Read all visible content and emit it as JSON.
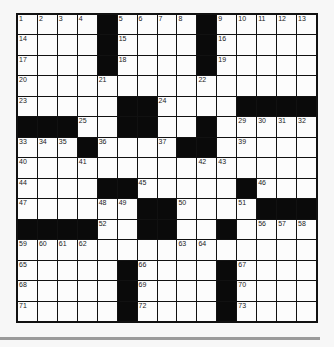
{
  "puzzle": {
    "rows": 15,
    "cols": 15,
    "grid": [
      "....#....#.....",
      "....#....#.....",
      "....#....#.....",
      "...............",
      ".....##....####",
      "###..##..#.....",
      "...#....##.....",
      "...............",
      "....##.....#...",
      "......##....###",
      "####..##..#....",
      "...............",
      ".....#....#....",
      ".....#....#....",
      ".....#....#...."
    ],
    "numbers": [
      {
        "r": 0,
        "c": 0,
        "n": "1"
      },
      {
        "r": 0,
        "c": 1,
        "n": "2"
      },
      {
        "r": 0,
        "c": 2,
        "n": "3"
      },
      {
        "r": 0,
        "c": 3,
        "n": "4"
      },
      {
        "r": 0,
        "c": 5,
        "n": "5"
      },
      {
        "r": 0,
        "c": 6,
        "n": "6"
      },
      {
        "r": 0,
        "c": 7,
        "n": "7"
      },
      {
        "r": 0,
        "c": 8,
        "n": "8"
      },
      {
        "r": 0,
        "c": 10,
        "n": "9"
      },
      {
        "r": 0,
        "c": 11,
        "n": "10"
      },
      {
        "r": 0,
        "c": 12,
        "n": "11"
      },
      {
        "r": 0,
        "c": 13,
        "n": "12"
      },
      {
        "r": 0,
        "c": 14,
        "n": "13"
      },
      {
        "r": 1,
        "c": 0,
        "n": "14"
      },
      {
        "r": 1,
        "c": 5,
        "n": "15"
      },
      {
        "r": 1,
        "c": 10,
        "n": "16"
      },
      {
        "r": 2,
        "c": 0,
        "n": "17"
      },
      {
        "r": 2,
        "c": 5,
        "n": "18"
      },
      {
        "r": 2,
        "c": 10,
        "n": "19"
      },
      {
        "r": 3,
        "c": 0,
        "n": "20"
      },
      {
        "r": 3,
        "c": 4,
        "n": "21"
      },
      {
        "r": 3,
        "c": 9,
        "n": "22"
      },
      {
        "r": 4,
        "c": 0,
        "n": "23"
      },
      {
        "r": 4,
        "c": 7,
        "n": "24"
      },
      {
        "r": 5,
        "c": 3,
        "n": "25"
      },
      {
        "r": 5,
        "c": 5,
        "n": "26"
      },
      {
        "r": 5,
        "c": 6,
        "n": "27"
      },
      {
        "r": 5,
        "c": 9,
        "n": "28"
      },
      {
        "r": 5,
        "c": 11,
        "n": "29"
      },
      {
        "r": 5,
        "c": 12,
        "n": "30"
      },
      {
        "r": 5,
        "c": 13,
        "n": "31"
      },
      {
        "r": 5,
        "c": 14,
        "n": "32"
      },
      {
        "r": 6,
        "c": 0,
        "n": "33"
      },
      {
        "r": 6,
        "c": 1,
        "n": "34"
      },
      {
        "r": 6,
        "c": 2,
        "n": "35"
      },
      {
        "r": 6,
        "c": 4,
        "n": "36"
      },
      {
        "r": 6,
        "c": 7,
        "n": "37"
      },
      {
        "r": 6,
        "c": 8,
        "n": "38"
      },
      {
        "r": 6,
        "c": 11,
        "n": "39"
      },
      {
        "r": 7,
        "c": 0,
        "n": "40"
      },
      {
        "r": 7,
        "c": 3,
        "n": "41"
      },
      {
        "r": 7,
        "c": 9,
        "n": "42"
      },
      {
        "r": 7,
        "c": 10,
        "n": "43"
      },
      {
        "r": 8,
        "c": 0,
        "n": "44"
      },
      {
        "r": 8,
        "c": 6,
        "n": "45"
      },
      {
        "r": 8,
        "c": 12,
        "n": "46"
      },
      {
        "r": 9,
        "c": 0,
        "n": "47"
      },
      {
        "r": 9,
        "c": 4,
        "n": "48"
      },
      {
        "r": 9,
        "c": 5,
        "n": "49"
      },
      {
        "r": 9,
        "c": 8,
        "n": "50"
      },
      {
        "r": 9,
        "c": 11,
        "n": "51"
      },
      {
        "r": 10,
        "c": 4,
        "n": "52"
      },
      {
        "r": 10,
        "c": 6,
        "n": "53"
      },
      {
        "r": 10,
        "c": 7,
        "n": "54"
      },
      {
        "r": 10,
        "c": 10,
        "n": "55"
      },
      {
        "r": 10,
        "c": 12,
        "n": "56"
      },
      {
        "r": 10,
        "c": 13,
        "n": "57"
      },
      {
        "r": 10,
        "c": 14,
        "n": "58"
      },
      {
        "r": 11,
        "c": 0,
        "n": "59"
      },
      {
        "r": 11,
        "c": 1,
        "n": "60"
      },
      {
        "r": 11,
        "c": 2,
        "n": "61"
      },
      {
        "r": 11,
        "c": 3,
        "n": "62"
      },
      {
        "r": 11,
        "c": 8,
        "n": "63"
      },
      {
        "r": 11,
        "c": 9,
        "n": "64"
      },
      {
        "r": 12,
        "c": 0,
        "n": "65"
      },
      {
        "r": 12,
        "c": 6,
        "n": "66"
      },
      {
        "r": 12,
        "c": 11,
        "n": "67"
      },
      {
        "r": 13,
        "c": 0,
        "n": "68"
      },
      {
        "r": 13,
        "c": 6,
        "n": "69"
      },
      {
        "r": 13,
        "c": 11,
        "n": "70"
      },
      {
        "r": 14,
        "c": 0,
        "n": "71"
      },
      {
        "r": 14,
        "c": 6,
        "n": "72"
      },
      {
        "r": 14,
        "c": 11,
        "n": "73"
      }
    ],
    "letters": []
  },
  "colors": {
    "block": "#0a0a0a",
    "cell": "#fcfcfc",
    "grid_line": "#111111",
    "divider": "#9a9a9a"
  }
}
